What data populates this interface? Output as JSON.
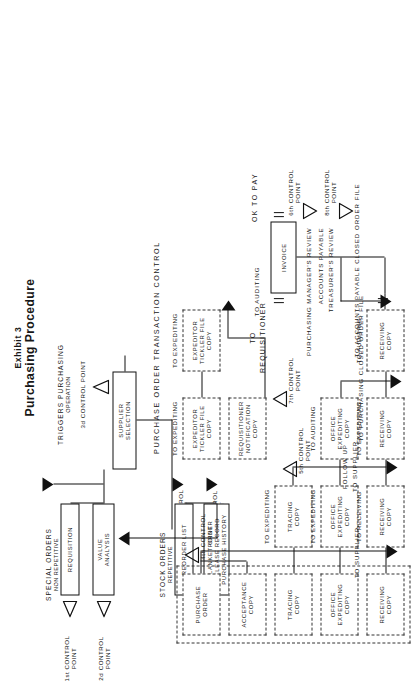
{
  "figure": {
    "exhibit_label": "Exhibit 3",
    "title": "Purchasing Procedure"
  },
  "headings": {
    "special_orders": "SPECIAL ORDERS",
    "special_orders_sub": "NON REPETITIVE",
    "stock_orders": "STOCK ORDERS",
    "stock_orders_sub": "REPETITIVE",
    "triggers": "TRIGGERS PURCHASING",
    "triggers_sub": "OPERATION",
    "transaction_control": "PURCHASE ORDER TRANSACTION CONTROL",
    "ok_to_pay": "OK TO PAY"
  },
  "boxes": {
    "requisition": "REQUISITION",
    "value_analysis": "VALUE\nANALYSIS",
    "reorder_list": "REORDER LIST",
    "blanket_order": "BLANKET ORDER\nRELEASE RECORD\nPURCHASE HISTORY",
    "supplier_selection": "SUPPLIER\nSELECTION",
    "invoice": "INVOICE"
  },
  "copies": [
    {
      "name": "purchase-order-copy",
      "label": "PURCHASE\nORDER",
      "route": "TO SUPPLIER"
    },
    {
      "name": "acceptance-copy",
      "label": "ACCEPTANCE\nCOPY",
      "route": ""
    },
    {
      "name": "tracing-copy",
      "label": "TRACING\nCOPY",
      "route": "TO EXPEDITING"
    },
    {
      "name": "tracing-copy-2",
      "label": "TRACING\nCOPY",
      "route": ""
    },
    {
      "name": "office-expediting-copy",
      "label": "OFFICE\nEXPEDITING\nCOPY",
      "route": "TO EXPEDITING"
    },
    {
      "name": "office-expediting-copy-2",
      "label": "OFFICE\nEXPEDITING\nCOPY",
      "route": ""
    },
    {
      "name": "office-expediting-copy-3",
      "label": "OFFICE\nEXPEDITING\nCOPY",
      "route": "TO AUDITING"
    },
    {
      "name": "receiving-copy",
      "label": "RECEIVING\nCOPY",
      "route": "TO RECEIVING"
    },
    {
      "name": "receiving-copy-2",
      "label": "RECEIVING\nCOPY",
      "route": ""
    },
    {
      "name": "receiving-copy-3",
      "label": "RECEIVING\nCOPY",
      "route": "TO EXPEDITING"
    },
    {
      "name": "receiving-copy-4",
      "label": "RECEIVING\nCOPY",
      "route": "TO AUDITING"
    },
    {
      "name": "requisitioner-notification-copy",
      "label": "REQUISITIONER\nNOTIFICATION\nCOPY",
      "route": ""
    },
    {
      "name": "expeditor-tickler-file-copy",
      "label": "EXPEDITOR\nTICKLER FILE\nCOPY",
      "route": "TO EXPEDITING"
    },
    {
      "name": "expeditor-tickler-file-copy-2",
      "label": "EXPEDITOR\nTICKLER FILE\nCOPY",
      "route": "TO EXPEDITING"
    }
  ],
  "routes": {
    "to_supplier": "TO SUPPLIER",
    "to_expediting": "TO EXPEDITING",
    "to_receiving": "TO RECEIVING",
    "to_auditing": "TO AUDITING",
    "to_requisitioner": "TO\nREQUISITIONER",
    "to_requisitioner_line1": "TO",
    "to_requisitioner_line2": "REQUISITIONER",
    "follow_up": "FOLLOW UP",
    "follow_up_to_supplier": "TO SUPPLIER",
    "to_purchasing_closed": "TO PURCHASING CLOSED ORDER FILE",
    "to_ap_closed": "TO ACCOUNTS PAYABLE CLOSED ORDER FILE"
  },
  "reviews": {
    "purchasing_manager": "PURCHASING MANAGER'S REVIEW",
    "accounts_payable": "ACCOUNTS PAYABLE",
    "treasurer": "TREASURER'S REVIEW"
  },
  "control_points": [
    {
      "name": "control-point-1-left",
      "label": "1st CONTROL\nPOINT",
      "shape": "open"
    },
    {
      "name": "control-point-2-left",
      "label": "2d CONTROL\nPOINT",
      "shape": "open"
    },
    {
      "name": "control-point-1-stock",
      "label": "1st CONTROL\nPOINT",
      "shape": "open"
    },
    {
      "name": "control-point-2-stock",
      "label": "2d CONTROL\nPOINT",
      "shape": "open"
    },
    {
      "name": "control-point-3",
      "label": "3d CONTROL POINT",
      "shape": "open"
    },
    {
      "name": "control-point-4",
      "label": "4th CONTROL\nPOINT",
      "shape": "open"
    },
    {
      "name": "control-point-5",
      "label": "5th CONTROL\nPOINT",
      "shape": "open"
    },
    {
      "name": "control-point-6",
      "label": "6th CONTROL\nPOINT",
      "shape": "open"
    },
    {
      "name": "control-point-7",
      "label": "7th CONTROL\nPOINT",
      "shape": "open"
    },
    {
      "name": "control-point-8",
      "label": "8th CONTROL\nPOINT",
      "shape": "open"
    }
  ],
  "colors": {
    "ink": "#111111",
    "paper": "#ffffff",
    "dash": "#333333"
  }
}
